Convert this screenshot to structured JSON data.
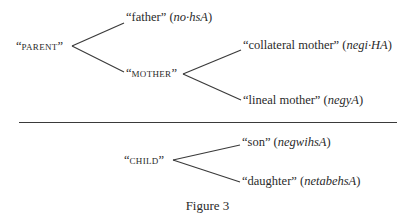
{
  "figure": {
    "caption": "Figure 3",
    "upper_tree": {
      "root": {
        "label": "PARENT",
        "open_quote": "“",
        "close_quote": "”"
      },
      "children": [
        {
          "gloss": "father",
          "term": "no·hsA"
        },
        {
          "label": "MOTHER",
          "children": [
            {
              "gloss": "collateral mother",
              "term": "negi·HA"
            },
            {
              "gloss": "lineal mother",
              "term": "negyA"
            }
          ]
        }
      ]
    },
    "lower_tree": {
      "root": {
        "label": "CHILD"
      },
      "children": [
        {
          "gloss": "son",
          "term": "negwihsA"
        },
        {
          "gloss": "daughter",
          "term": "netabehsA"
        }
      ]
    },
    "colors": {
      "text": "#2a2a2a",
      "line": "#3a3a3a",
      "background": "#ffffff"
    }
  }
}
